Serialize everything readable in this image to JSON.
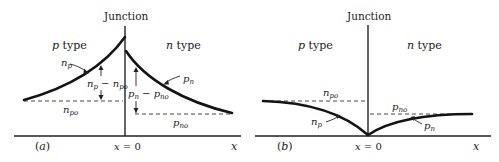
{
  "panel_a": {
    "caption": "(a)",
    "junction_label": "Junction",
    "p_region_label": "p type",
    "n_region_label": "n type",
    "curve_p_label": "n_p",
    "curve_n_label": "p_n",
    "equilibrium_p_label": "n_po",
    "equilibrium_n_label": "p_no",
    "excess_p_label": "n_p − n_po",
    "excess_n_label": "p_n − p_no",
    "origin_label": "x = 0",
    "axis_label": "x",
    "description": "Minority carrier injection: concentrations rise above equilibrium near the junction"
  },
  "panel_b": {
    "caption": "(b)",
    "junction_label": "Junction",
    "p_region_label": "p type",
    "n_region_label": "n type",
    "curve_p_label": "n_p",
    "curve_n_label": "p_n",
    "equilibrium_p_label": "n_po",
    "equilibrium_n_label": "p_no",
    "origin_label": "x = 0",
    "axis_label": "x",
    "description": "Minority carrier extraction: concentrations fall to zero at the junction"
  },
  "colors": {
    "ink": "#141414",
    "background": "#ffffff"
  }
}
